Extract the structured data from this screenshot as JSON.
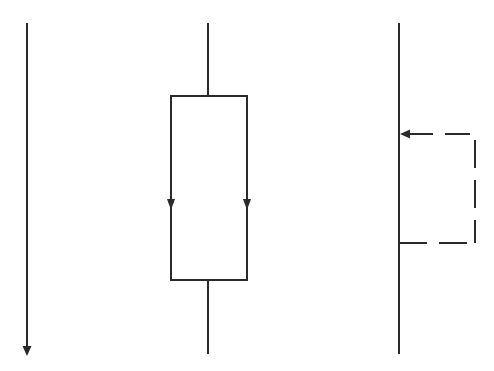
{
  "diagram": {
    "stroke_color": "#2a2a2a",
    "background": "#ffffff",
    "panels": [
      {
        "name": "sequence",
        "type": "single downward arrow"
      },
      {
        "name": "parallel-branch",
        "type": "rectangle with two downward arrows"
      },
      {
        "name": "loop-back",
        "type": "line with dashed feedback loop arrow"
      }
    ]
  }
}
